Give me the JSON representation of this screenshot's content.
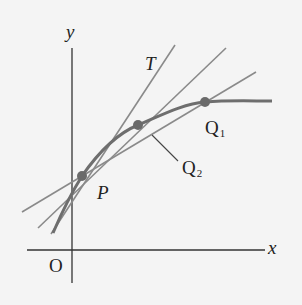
{
  "figure": {
    "colors": {
      "background": "#f4f4f4",
      "axes": "#333333",
      "lines": "#8a8a8a",
      "curve": "#6e6e6e",
      "points": "#6a6a6a",
      "text": "#222222"
    },
    "axes": {
      "x_label": "x",
      "y_label": "y",
      "origin_label": "O"
    },
    "points": [
      {
        "name": "P",
        "label": "P",
        "subscript": ""
      },
      {
        "name": "Q1",
        "label": "Q",
        "subscript": "1"
      },
      {
        "name": "Q2",
        "label": "Q",
        "subscript": "2"
      }
    ],
    "lines": [
      {
        "name": "tangent",
        "label": "T"
      },
      {
        "name": "secant-PQ2",
        "label": ""
      },
      {
        "name": "secant-PQ1",
        "label": ""
      }
    ],
    "curve": {
      "name": "function-curve"
    }
  }
}
